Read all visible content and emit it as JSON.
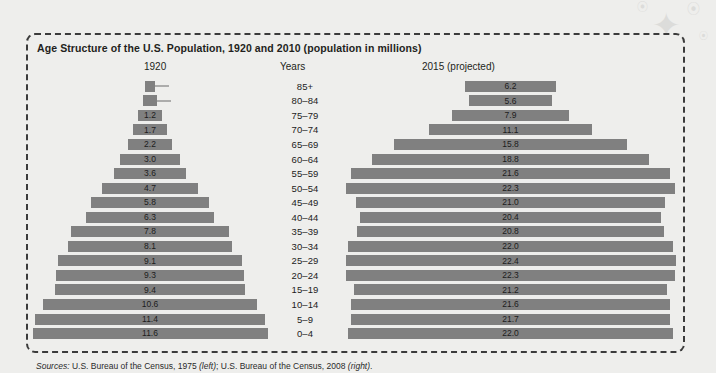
{
  "figure": {
    "title": "Age Structure of the U.S. Population, 1920 and 2010 (population in millions)",
    "header_left": "1920",
    "header_middle": "Years",
    "header_right": "2015 (projected)",
    "sources_prefix": "Sources:",
    "sources_left": " U.S. Bureau of the Census, 1975 ",
    "sources_left_note": "(left)",
    "sources_mid": "; U.S. Bureau of the Census, 2008 ",
    "sources_right_note": "(right)",
    "sources_end": ".",
    "bar_color": "#808080",
    "border_color": "#3b3b3b",
    "background_color": "#eeeeec"
  },
  "chart_data": {
    "type": "bar",
    "chart_subtype": "population-pyramid",
    "title": "Age Structure of the U.S. Population, 1920 and 2010 (population in millions)",
    "xlabel": "Population (millions)",
    "ylabel": "Years",
    "categories": [
      "85+",
      "80-84",
      "75-79",
      "70-74",
      "65-69",
      "60-64",
      "55-59",
      "50-54",
      "45-49",
      "40-44",
      "35-39",
      "30-34",
      "25-29",
      "20-24",
      "15-19",
      "10-14",
      "5-9",
      "0-4"
    ],
    "series": [
      {
        "name": "1920",
        "label": "1920",
        "side": "left",
        "values": [
          0.5,
          0.7,
          1.2,
          1.7,
          2.2,
          3.0,
          3.6,
          4.7,
          5.8,
          6.3,
          7.8,
          8.1,
          9.1,
          9.3,
          9.4,
          10.6,
          11.4,
          11.6
        ]
      },
      {
        "name": "2015 (projected)",
        "label": "2015 (projected)",
        "side": "right",
        "values": [
          6.2,
          5.6,
          7.9,
          11.1,
          15.8,
          18.8,
          21.6,
          22.3,
          21.0,
          20.4,
          20.8,
          22.0,
          22.4,
          22.3,
          21.2,
          21.6,
          21.7,
          22.0
        ]
      }
    ],
    "xlim": [
      0,
      22.4
    ],
    "grid": false,
    "legend": "none",
    "value_labels": true,
    "callout_rows": [
      "85+",
      "80-84"
    ]
  }
}
